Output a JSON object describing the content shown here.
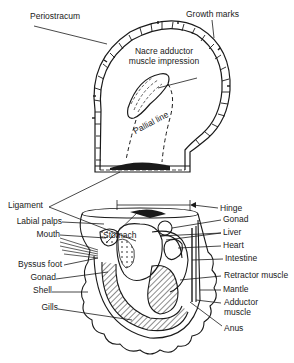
{
  "diagram": {
    "top_view_labels": {
      "periostracum": "Periostracum",
      "growth_marks": "Growth marks",
      "nacre_line1": "Nacre adductor",
      "nacre_line2": "muscle impression",
      "pallial_line": "Pallial line",
      "ligament": "Ligament",
      "hinge": "Hinge"
    },
    "bottom_view_labels": {
      "stomach": "Stomach",
      "left": [
        "Labial palps",
        "Mouth",
        "Byssus foot",
        "Gonad",
        "Shell",
        "Gills"
      ],
      "right": [
        "Gonad",
        "Liver",
        "Heart",
        "Intestine",
        "Retractor muscle",
        "Mantle"
      ],
      "adductor_line1": "Adductor",
      "adductor_line2": "muscle",
      "anus": "Anus"
    },
    "colors": {
      "ink": "#1a1a1a",
      "background": "#ffffff"
    }
  }
}
